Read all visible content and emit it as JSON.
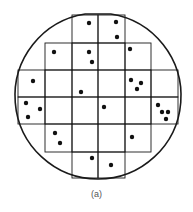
{
  "figure": {
    "caption": "(a)",
    "colors": {
      "line": "#1a1a1a",
      "dot": "#111111",
      "background": "#ffffff",
      "caption": "#555555"
    },
    "wafer": {
      "center": [
        98,
        96
      ],
      "radius": 83,
      "flat_top_y": 14,
      "flat_bottom_y": 179
    },
    "grid": {
      "cols_x": [
        18,
        45,
        72,
        98,
        125,
        151,
        178
      ],
      "rows_y": [
        15,
        43,
        70,
        97,
        124,
        152,
        178
      ],
      "dies": [
        {
          "row": 0,
          "cols": [
            2,
            3
          ]
        },
        {
          "row": 1,
          "cols": [
            1,
            2,
            3,
            4
          ]
        },
        {
          "row": 2,
          "cols": [
            0,
            1,
            2,
            3,
            4,
            5
          ]
        },
        {
          "row": 3,
          "cols": [
            0,
            1,
            2,
            3,
            4,
            5
          ]
        },
        {
          "row": 4,
          "cols": [
            1,
            2,
            3,
            4
          ]
        },
        {
          "row": 5,
          "cols": [
            2,
            3
          ]
        }
      ]
    },
    "defects": [
      [
        89,
        23
      ],
      [
        116,
        22
      ],
      [
        117,
        37
      ],
      [
        54,
        52
      ],
      [
        89,
        52
      ],
      [
        92,
        62
      ],
      [
        130,
        49
      ],
      [
        33,
        81
      ],
      [
        81,
        92
      ],
      [
        131,
        80
      ],
      [
        141,
        83
      ],
      [
        137,
        89
      ],
      [
        26,
        103
      ],
      [
        40,
        109
      ],
      [
        28,
        117
      ],
      [
        104,
        107
      ],
      [
        158,
        105
      ],
      [
        162,
        112
      ],
      [
        168,
        112
      ],
      [
        166,
        119
      ],
      [
        55,
        133
      ],
      [
        60,
        143
      ],
      [
        132,
        137
      ],
      [
        92,
        158
      ],
      [
        111,
        165
      ]
    ],
    "defect_count": 25
  }
}
